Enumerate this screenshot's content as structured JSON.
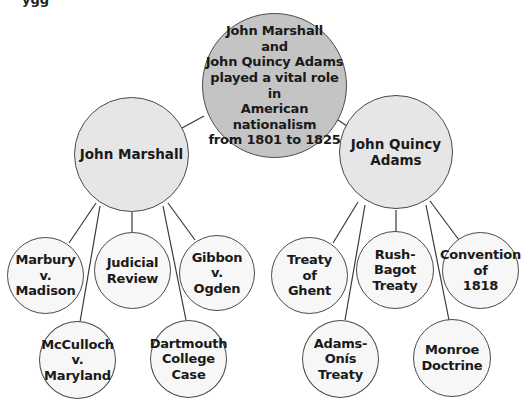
{
  "page_fragment": "ygg",
  "diagram": {
    "root": {
      "label": "John Marshall\nand\nJohn Quincy Adams\nplayed a vital role in\nAmerican nationalism\nfrom 1801 to 1825"
    },
    "branches": [
      {
        "label": "John Marshall",
        "children": [
          {
            "label": "Marbury\nv.\nMadison"
          },
          {
            "label": "McCulloch\nv.\nMaryland"
          },
          {
            "label": "Judicial\nReview"
          },
          {
            "label": "Dartmouth\nCollege\nCase"
          },
          {
            "label": "Gibbon\nv.\nOgden"
          }
        ]
      },
      {
        "label": "John Quincy\nAdams",
        "children": [
          {
            "label": "Treaty\nof\nGhent"
          },
          {
            "label": "Adams-Onís\nTreaty"
          },
          {
            "label": "Rush-Bagot\nTreaty"
          },
          {
            "label": "Monroe\nDoctrine"
          },
          {
            "label": "Convention\nof\n1818"
          }
        ]
      }
    ]
  },
  "colors": {
    "root_fill": "#c4c4c4",
    "branch_fill": "#e6e6e6",
    "leaf_fill": "#f7f7f7",
    "stroke": "#4a4a4a"
  }
}
